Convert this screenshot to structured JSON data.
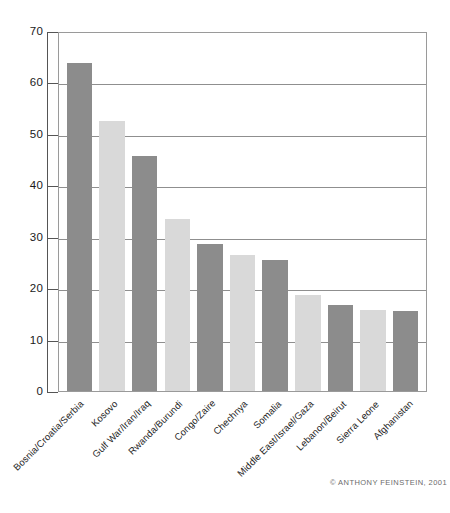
{
  "chart_data": {
    "type": "bar",
    "title": "",
    "subtitle": "",
    "xlabel": "",
    "ylabel": "",
    "ylim": [
      0,
      70
    ],
    "ytick_step": 10,
    "yticks": [
      "70",
      "60",
      "50",
      "40",
      "30",
      "20",
      "10",
      "0"
    ],
    "grid": true,
    "gridlines_at": [
      10,
      20,
      30,
      40,
      50,
      60
    ],
    "legend": "none",
    "categories": [
      "Bosnia/Croatia/Serbia",
      "Kosovo",
      "Gulf War/Iran/Iraq",
      "Rwanda/Burundi",
      "Congo/Zaire",
      "Chechnya",
      "Somalia",
      "Middle East/Israel/Gaza",
      "Lebanon/Beirut",
      "Sierra Leone",
      "Afghanistan"
    ],
    "values": [
      63.7,
      52.6,
      45.7,
      33.4,
      28.5,
      26.5,
      25.5,
      18.6,
      16.7,
      15.8,
      15.5
    ],
    "bar_colors": [
      "#8c8c8c",
      "#d9d9d9",
      "#8c8c8c",
      "#d9d9d9",
      "#8c8c8c",
      "#d9d9d9",
      "#8c8c8c",
      "#d9d9d9",
      "#8c8c8c",
      "#d9d9d9",
      "#8c8c8c"
    ]
  },
  "footer": {
    "copyright": "© ANTHONY FEINSTEIN, 2001"
  },
  "colors": {
    "bar_dark": "#8c8c8c",
    "bar_light": "#d9d9d9",
    "gridline": "#8f8f8f",
    "frame": "#9a9a9a",
    "axis": "#555555",
    "text": "#1a1a1a",
    "background": "#ffffff"
  }
}
